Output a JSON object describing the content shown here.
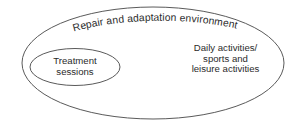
{
  "diagram": {
    "type": "venn-nested-ellipses",
    "background_color": "#ffffff",
    "stroke_color": "#5a5a5a",
    "text_color": "#2b2b2b",
    "outer_ellipse": {
      "label": "Repair and adaptation environment",
      "label_style": "curved-along-top-arc"
    },
    "inner_ellipse": {
      "label_lines": [
        "Treatment",
        "sessions"
      ]
    },
    "outer_region": {
      "label_lines": [
        "Daily activities/",
        "sports and",
        "leisure activities"
      ]
    }
  }
}
